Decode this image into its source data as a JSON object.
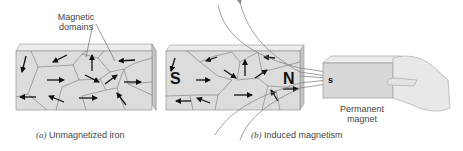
{
  "figure": {
    "panel_a": {
      "annotation": [
        "Magnetic",
        "domains"
      ],
      "caption_letter": "(a)",
      "caption_text": "Unmagnetized iron"
    },
    "panel_b": {
      "pole_left": "S",
      "pole_right": "N",
      "caption_letter": "(b)",
      "caption_text": "Induced magnetism"
    },
    "magnet": {
      "pole": "s",
      "label": [
        "Permanent",
        "magnet"
      ]
    },
    "colors": {
      "block_face": "#dcdcdc",
      "block_top": "#ececec",
      "block_side": "#c4c4c4",
      "domain_line": "#777777",
      "arrow": "#111111",
      "field_line": "#888888",
      "hand": "#e8e8e8"
    }
  }
}
